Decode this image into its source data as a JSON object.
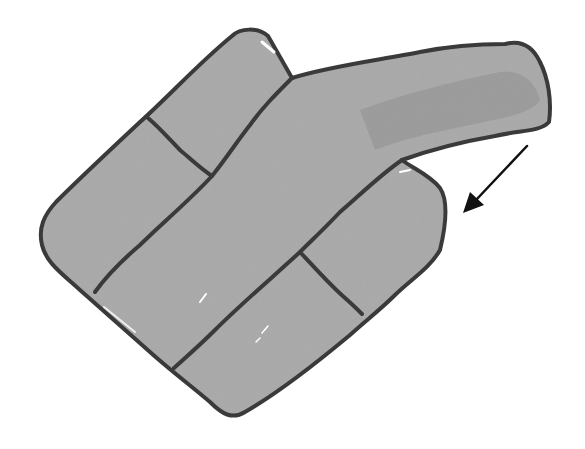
{
  "illustration": {
    "subject": "hand-drawn gray watercolor shape of rounded brick-like segments forming a hand/paddle with an extended arm",
    "fill_color": "#a3a3a3",
    "fill_color_dark": "#949494",
    "outline_color": "#3a3a3a",
    "background": "#ffffff",
    "segment_count": 5,
    "arrow": {
      "icon": "arrow-down-left-icon",
      "direction": "down-left",
      "color": "#111111"
    }
  }
}
